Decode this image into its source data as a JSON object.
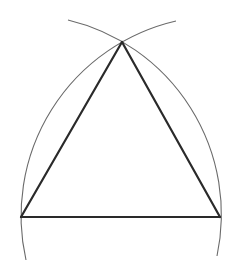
{
  "diagram": {
    "colors": {
      "background": "#ffffff",
      "triangle_stroke": "#2a2a2a",
      "arc_stroke": "#6a6a6a"
    },
    "vertices": {
      "apex": [
        122,
        42
      ],
      "left": [
        21,
        217
      ],
      "right": [
        220,
        217
      ]
    },
    "arcs": [
      {
        "name": "arc-centered-right-vertex",
        "center": [
          220,
          217
        ],
        "radius": 200,
        "from": [
          26,
          260
        ],
        "to": [
          176,
          21
        ]
      },
      {
        "name": "arc-centered-left-vertex",
        "center": [
          21,
          217
        ],
        "radius": 200,
        "from": [
          217,
          256
        ],
        "to": [
          68,
          20
        ]
      }
    ]
  }
}
